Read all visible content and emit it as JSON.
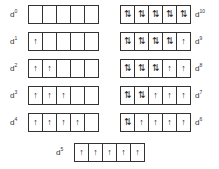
{
  "configs": [
    {
      "label": "d",
      "n": "0",
      "boxes": [
        "",
        "",
        "",
        "",
        ""
      ]
    },
    {
      "label": "d",
      "n": "1",
      "boxes": [
        "↑",
        "",
        "",
        "",
        ""
      ]
    },
    {
      "label": "d",
      "n": "2",
      "boxes": [
        "↑",
        "↑",
        "",
        "",
        ""
      ]
    },
    {
      "label": "d",
      "n": "3",
      "boxes": [
        "↑",
        "↑",
        "↑",
        "",
        ""
      ]
    },
    {
      "label": "d",
      "n": "4",
      "boxes": [
        "↑",
        "↑",
        "↑",
        "↑",
        ""
      ]
    },
    {
      "label": "d",
      "n": "10",
      "boxes": [
        "⇅",
        "⇅",
        "⇅",
        "⇅",
        "⇅"
      ]
    },
    {
      "label": "d",
      "n": "9",
      "boxes": [
        "⇅",
        "⇅",
        "⇅",
        "⇅",
        "↑"
      ]
    },
    {
      "label": "d",
      "n": "8",
      "boxes": [
        "⇅",
        "⇅",
        "⇅",
        "↑",
        "↑"
      ]
    },
    {
      "label": "d",
      "n": "7",
      "boxes": [
        "⇅",
        "⇅",
        "↑",
        "↑",
        "↑"
      ]
    },
    {
      "label": "d",
      "n": "6",
      "boxes": [
        "⇅",
        "↑",
        "↑",
        "↑",
        "↑"
      ]
    },
    {
      "label": "d",
      "n": "5",
      "boxes": [
        "↑",
        "↑",
        "↑",
        "↑",
        "↑"
      ]
    }
  ]
}
